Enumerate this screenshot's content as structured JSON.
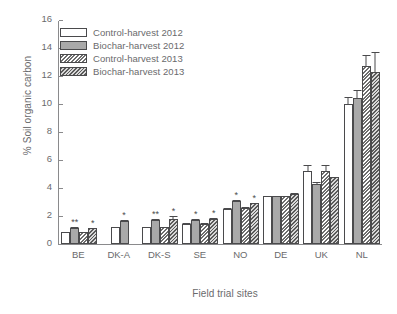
{
  "chart_data": {
    "type": "bar",
    "title": "",
    "xlabel": "Field trial sites",
    "ylabel": "% Soil organic carbon",
    "ylim": [
      0,
      16
    ],
    "yticks": [
      0,
      2,
      4,
      6,
      8,
      10,
      12,
      14,
      16
    ],
    "grid": false,
    "legend_position": "top-left",
    "categories": [
      "BE",
      "DK-A",
      "DK-S",
      "SE",
      "NO",
      "DE",
      "UK",
      "NL"
    ],
    "series": [
      {
        "name": "Control-harvest 2012",
        "key": "control_2012",
        "values": [
          0.85,
          1.2,
          1.2,
          1.45,
          2.5,
          3.4,
          5.2,
          10.0
        ],
        "errors": [
          0.1,
          0.1,
          0.12,
          0.1,
          0.15,
          0.1,
          0.55,
          0.55
        ],
        "significance": [
          "",
          "",
          "",
          "",
          "",
          "",
          "",
          ""
        ]
      },
      {
        "name": "Biochar-harvest 2012",
        "key": "biochar_2012",
        "values": [
          1.15,
          1.65,
          1.7,
          1.75,
          3.1,
          3.4,
          4.3,
          10.4
        ],
        "errors": [
          0.12,
          0.12,
          0.13,
          0.1,
          0.15,
          0.1,
          0.2,
          0.7
        ],
        "significance": [
          "**",
          "*",
          "**",
          "*",
          "*",
          "",
          "",
          ""
        ]
      },
      {
        "name": "Control-harvest 2013",
        "key": "control_2013",
        "values": [
          0.85,
          null,
          1.2,
          1.45,
          2.6,
          3.4,
          5.2,
          12.7
        ],
        "errors": [
          0.1,
          null,
          0.12,
          0.1,
          0.12,
          0.1,
          0.5,
          0.9
        ],
        "significance": [
          "",
          null,
          "",
          "",
          "",
          "",
          "",
          ""
        ]
      },
      {
        "name": "Biochar-harvest 2013",
        "key": "biochar_2013",
        "values": [
          1.15,
          null,
          1.8,
          1.8,
          2.9,
          3.6,
          4.8,
          12.3
        ],
        "errors": [
          0.1,
          null,
          0.25,
          0.12,
          0.12,
          0.1,
          0.05,
          1.5
        ],
        "significance": [
          "*",
          null,
          "*",
          "*",
          "*",
          "",
          "",
          ""
        ]
      }
    ],
    "colors": {
      "control_2012": "#ffffff",
      "biochar_2012": "#a9a9a9",
      "control_2013": "#8c8c8c",
      "biochar_2013": "#4f4f4f",
      "axis": "#8a8a8c",
      "text": "#6a6a6c"
    }
  }
}
